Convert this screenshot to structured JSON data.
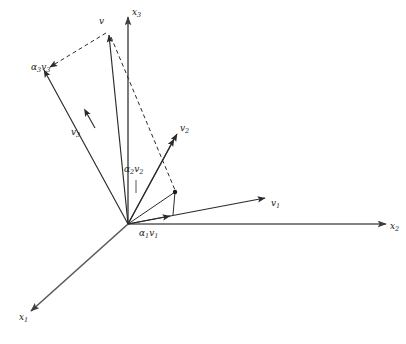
{
  "figure": {
    "background_color": "#ffffff",
    "line_color": "#2b2b2b",
    "axis_color": "#555555",
    "dash_color": "#3a3a3a",
    "width": 406,
    "height": 344
  },
  "axes": [
    {
      "name": "x1-axis",
      "label": "x",
      "subscript": "1",
      "from": [
        128,
        224
      ],
      "to": [
        30,
        312
      ],
      "label_pos": [
        22,
        316
      ],
      "arrow": true
    },
    {
      "name": "x2-axis",
      "label": "x",
      "subscript": "2",
      "from": [
        128,
        224
      ],
      "to": [
        387,
        224
      ],
      "label_pos": [
        391,
        227
      ],
      "arrow": true
    },
    {
      "name": "x3-axis",
      "label": "x",
      "subscript": "3",
      "from": [
        128,
        224
      ],
      "to": [
        128,
        16
      ],
      "label_pos": [
        133,
        13
      ],
      "arrow": true
    }
  ],
  "vectors": [
    {
      "name": "vector-v",
      "label": "v",
      "subscript": "",
      "from": [
        128,
        224
      ],
      "to": [
        108,
        32
      ],
      "label_pos": [
        100,
        22
      ],
      "style": "solid"
    },
    {
      "name": "vector-v1",
      "label": "v",
      "subscript": "1",
      "from": [
        128,
        224
      ],
      "to": [
        267,
        198
      ],
      "label_pos": [
        272,
        205
      ],
      "style": "solid"
    },
    {
      "name": "vector-v2",
      "label": "v",
      "subscript": "2",
      "from": [
        128,
        224
      ],
      "to": [
        178,
        132
      ],
      "label_pos": [
        181,
        130
      ],
      "style": "solid"
    },
    {
      "name": "vector-v3",
      "label": "v",
      "subscript": "3",
      "from": [
        128,
        224
      ],
      "to": [
        42,
        68
      ],
      "label_pos": [
        72,
        133
      ],
      "style": "solid",
      "midarrow_at": [
        88,
        116
      ]
    }
  ],
  "components": [
    {
      "name": "component-alpha1-v1",
      "coefficient": "α",
      "coefficient_sub": "1",
      "label": "v",
      "subscript": "1",
      "from": [
        128,
        224
      ],
      "to": [
        172,
        216
      ],
      "label_pos": [
        140,
        233
      ],
      "style": "solid"
    },
    {
      "name": "component-alpha2-v2",
      "coefficient": "α",
      "coefficient_sub": "2",
      "label": "v",
      "subscript": "2",
      "from": [
        128,
        224
      ],
      "to": [
        175,
        137
      ],
      "label_pos": [
        128,
        170
      ],
      "leader_from": [
        136,
        178
      ],
      "leader_to": [
        136,
        192
      ],
      "style": "solid"
    },
    {
      "name": "component-alpha3-v3",
      "coefficient": "α",
      "coefficient_sub": "3",
      "label": "v",
      "subscript": "3",
      "from": [
        128,
        224
      ],
      "to": [
        42,
        68
      ],
      "label_pos": [
        36,
        70
      ],
      "style": "solid"
    }
  ],
  "dashed_lines": [
    {
      "name": "dashed-v-to-alpha3v3",
      "from": [
        108,
        32
      ],
      "to": [
        48,
        68
      ],
      "arrow_at_end": true
    },
    {
      "name": "dashed-v-to-parallelogram-vertex",
      "from": [
        110,
        36
      ],
      "to": [
        175,
        192
      ],
      "arrow_at_end": false
    }
  ],
  "solid_construction_lines": [
    {
      "name": "parallelogram-edge-lower",
      "from": [
        128,
        224
      ],
      "to": [
        175,
        192
      ]
    },
    {
      "name": "parallelogram-edge-upper",
      "from": [
        172,
        216
      ],
      "to": [
        175,
        192
      ]
    }
  ],
  "markers": [
    {
      "name": "vertex-dot",
      "pos": [
        175,
        192
      ],
      "radius": 2.2
    }
  ]
}
